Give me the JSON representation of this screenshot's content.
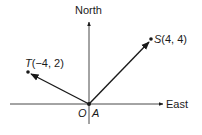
{
  "diagram": {
    "type": "vector-diagram",
    "axes": {
      "vertical_label": "North",
      "horizontal_label": "East"
    },
    "origin": {
      "label_o": "O",
      "label_a": "A"
    },
    "points": [
      {
        "name": "S",
        "coords": "(4, 4)",
        "x": 4,
        "y": 4
      },
      {
        "name": "T",
        "coords": "(−4, 2)",
        "x": -4,
        "y": 2
      }
    ],
    "vectors": [
      {
        "from": "A",
        "to": "S"
      },
      {
        "from": "A",
        "to": "T"
      }
    ],
    "colors": {
      "ink": "#1a1a1a",
      "background": "#ffffff"
    }
  }
}
